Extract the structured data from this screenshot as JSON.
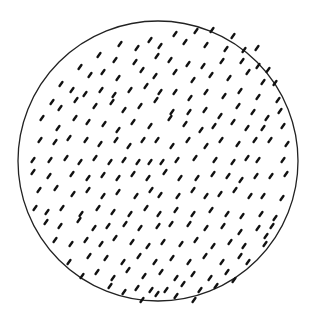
{
  "figure": {
    "circle": {
      "cx": 158,
      "cy": 161,
      "r": 140,
      "stroke": "#222222",
      "stroke_width": 1.3
    },
    "dash": {
      "color": "#111111",
      "length": 5,
      "width": 2.4,
      "angle_deg": -55
    },
    "dashes": [
      [
        150,
        40
      ],
      [
        175,
        34
      ],
      [
        196,
        31
      ],
      [
        212,
        30
      ],
      [
        233,
        36
      ],
      [
        120,
        44
      ],
      [
        137,
        48
      ],
      [
        160,
        46
      ],
      [
        185,
        42
      ],
      [
        206,
        45
      ],
      [
        226,
        49
      ],
      [
        244,
        50
      ],
      [
        257,
        48
      ],
      [
        99,
        55
      ],
      [
        115,
        60
      ],
      [
        135,
        62
      ],
      [
        157,
        56
      ],
      [
        170,
        60
      ],
      [
        188,
        64
      ],
      [
        203,
        66
      ],
      [
        222,
        61
      ],
      [
        242,
        61
      ],
      [
        258,
        66
      ],
      [
        268,
        70
      ],
      [
        80,
        67
      ],
      [
        90,
        75
      ],
      [
        103,
        72
      ],
      [
        118,
        78
      ],
      [
        142,
        70
      ],
      [
        155,
        76
      ],
      [
        175,
        72
      ],
      [
        193,
        80
      ],
      [
        211,
        75
      ],
      [
        229,
        78
      ],
      [
        248,
        72
      ],
      [
        263,
        82
      ],
      [
        275,
        83
      ],
      [
        61,
        84
      ],
      [
        72,
        90
      ],
      [
        85,
        94
      ],
      [
        101,
        90
      ],
      [
        114,
        95
      ],
      [
        130,
        90
      ],
      [
        146,
        86
      ],
      [
        160,
        92
      ],
      [
        175,
        92
      ],
      [
        190,
        98
      ],
      [
        206,
        92
      ],
      [
        224,
        96
      ],
      [
        240,
        91
      ],
      [
        258,
        97
      ],
      [
        278,
        100
      ],
      [
        52,
        102
      ],
      [
        60,
        108
      ],
      [
        76,
        100
      ],
      [
        95,
        106
      ],
      [
        112,
        102
      ],
      [
        124,
        110
      ],
      [
        140,
        106
      ],
      [
        156,
        100
      ],
      [
        172,
        112
      ],
      [
        189,
        112
      ],
      [
        205,
        110
      ],
      [
        220,
        116
      ],
      [
        238,
        106
      ],
      [
        253,
        112
      ],
      [
        267,
        118
      ],
      [
        280,
        111
      ],
      [
        42,
        118
      ],
      [
        58,
        128
      ],
      [
        75,
        118
      ],
      [
        88,
        122
      ],
      [
        104,
        124
      ],
      [
        118,
        130
      ],
      [
        133,
        122
      ],
      [
        150,
        126
      ],
      [
        170,
        118
      ],
      [
        185,
        124
      ],
      [
        201,
        130
      ],
      [
        214,
        126
      ],
      [
        233,
        122
      ],
      [
        247,
        128
      ],
      [
        263,
        128
      ],
      [
        283,
        126
      ],
      [
        40,
        140
      ],
      [
        55,
        142
      ],
      [
        69,
        138
      ],
      [
        86,
        140
      ],
      [
        100,
        144
      ],
      [
        116,
        140
      ],
      [
        129,
        146
      ],
      [
        143,
        140
      ],
      [
        157,
        140
      ],
      [
        172,
        146
      ],
      [
        188,
        140
      ],
      [
        206,
        146
      ],
      [
        221,
        140
      ],
      [
        238,
        144
      ],
      [
        255,
        140
      ],
      [
        270,
        140
      ],
      [
        287,
        144
      ],
      [
        33,
        160
      ],
      [
        50,
        160
      ],
      [
        66,
        158
      ],
      [
        80,
        162
      ],
      [
        95,
        158
      ],
      [
        110,
        162
      ],
      [
        124,
        160
      ],
      [
        138,
        162
      ],
      [
        150,
        162
      ],
      [
        162,
        162
      ],
      [
        177,
        160
      ],
      [
        195,
        158
      ],
      [
        215,
        160
      ],
      [
        233,
        162
      ],
      [
        247,
        158
      ],
      [
        258,
        160
      ],
      [
        283,
        160
      ],
      [
        33,
        172
      ],
      [
        49,
        176
      ],
      [
        72,
        174
      ],
      [
        88,
        178
      ],
      [
        103,
        175
      ],
      [
        118,
        178
      ],
      [
        133,
        174
      ],
      [
        148,
        178
      ],
      [
        165,
        172
      ],
      [
        180,
        178
      ],
      [
        197,
        178
      ],
      [
        213,
        174
      ],
      [
        228,
        176
      ],
      [
        241,
        180
      ],
      [
        256,
        176
      ],
      [
        271,
        176
      ],
      [
        286,
        174
      ],
      [
        39,
        190
      ],
      [
        56,
        188
      ],
      [
        73,
        194
      ],
      [
        88,
        190
      ],
      [
        103,
        196
      ],
      [
        118,
        192
      ],
      [
        136,
        196
      ],
      [
        151,
        190
      ],
      [
        160,
        195
      ],
      [
        178,
        196
      ],
      [
        193,
        190
      ],
      [
        206,
        196
      ],
      [
        220,
        194
      ],
      [
        235,
        190
      ],
      [
        250,
        196
      ],
      [
        263,
        196
      ],
      [
        282,
        198
      ],
      [
        35,
        208
      ],
      [
        47,
        212
      ],
      [
        62,
        208
      ],
      [
        81,
        214
      ],
      [
        98,
        208
      ],
      [
        113,
        212
      ],
      [
        130,
        214
      ],
      [
        146,
        208
      ],
      [
        159,
        214
      ],
      [
        176,
        210
      ],
      [
        193,
        214
      ],
      [
        211,
        210
      ],
      [
        227,
        214
      ],
      [
        242,
        216
      ],
      [
        261,
        214
      ],
      [
        275,
        218
      ],
      [
        46,
        222
      ],
      [
        60,
        226
      ],
      [
        79,
        220
      ],
      [
        94,
        228
      ],
      [
        108,
        226
      ],
      [
        125,
        224
      ],
      [
        140,
        228
      ],
      [
        158,
        226
      ],
      [
        171,
        224
      ],
      [
        189,
        224
      ],
      [
        206,
        228
      ],
      [
        223,
        226
      ],
      [
        240,
        232
      ],
      [
        258,
        228
      ],
      [
        272,
        226
      ],
      [
        266,
        236
      ],
      [
        55,
        240
      ],
      [
        71,
        244
      ],
      [
        86,
        240
      ],
      [
        101,
        244
      ],
      [
        115,
        238
      ],
      [
        132,
        242
      ],
      [
        148,
        246
      ],
      [
        163,
        242
      ],
      [
        181,
        244
      ],
      [
        196,
        240
      ],
      [
        213,
        246
      ],
      [
        230,
        242
      ],
      [
        244,
        246
      ],
      [
        265,
        244
      ],
      [
        69,
        262
      ],
      [
        89,
        256
      ],
      [
        106,
        258
      ],
      [
        123,
        262
      ],
      [
        139,
        256
      ],
      [
        155,
        262
      ],
      [
        172,
        258
      ],
      [
        189,
        262
      ],
      [
        205,
        256
      ],
      [
        222,
        262
      ],
      [
        240,
        256
      ],
      [
        248,
        262
      ],
      [
        82,
        276
      ],
      [
        97,
        272
      ],
      [
        113,
        278
      ],
      [
        128,
        270
      ],
      [
        144,
        276
      ],
      [
        161,
        272
      ],
      [
        176,
        278
      ],
      [
        193,
        274
      ],
      [
        210,
        278
      ],
      [
        227,
        272
      ],
      [
        234,
        280
      ],
      [
        110,
        286
      ],
      [
        124,
        292
      ],
      [
        137,
        288
      ],
      [
        151,
        290
      ],
      [
        166,
        290
      ],
      [
        183,
        284
      ],
      [
        200,
        290
      ],
      [
        216,
        286
      ],
      [
        142,
        300
      ],
      [
        157,
        294
      ],
      [
        176,
        296
      ],
      [
        194,
        300
      ]
    ]
  }
}
